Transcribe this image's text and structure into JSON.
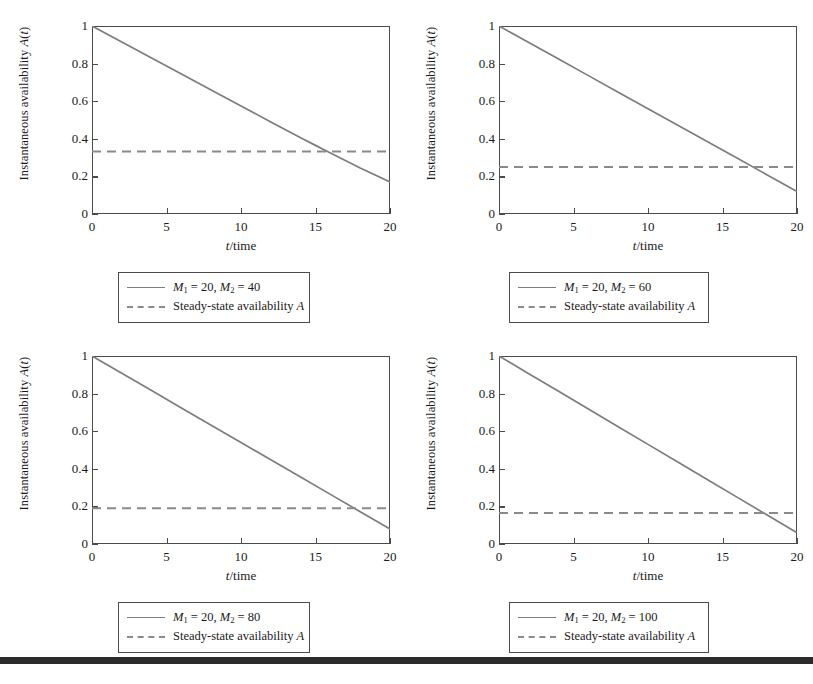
{
  "figure": {
    "axis": {
      "xlabel_plain": "t/time",
      "ylabel_plain": "Instantaneous availability A(t)",
      "yticks": [
        "0",
        "0.2",
        "0.4",
        "0.6",
        "0.8",
        "1"
      ],
      "xticks": [
        "0",
        "5",
        "10",
        "15",
        "20"
      ]
    },
    "colors": {
      "curve": "#7d7d7d",
      "steady_line": "#8a8a8a",
      "frame": "#4b4b4b",
      "text": "#1a1a1a",
      "bottom_rule": "#2b2b2b"
    },
    "panels": [
      {
        "id": "panel-top-left",
        "legend": {
          "series_label": "M1 = 20, M2 = 40",
          "series_M1": "20",
          "series_M2": "40",
          "steady_label": "Steady-state availability A"
        }
      },
      {
        "id": "panel-top-right",
        "legend": {
          "series_label": "M1 = 20, M2 = 60",
          "series_M1": "20",
          "series_M2": "60",
          "steady_label": "Steady-state availability A"
        }
      },
      {
        "id": "panel-bottom-left",
        "legend": {
          "series_label": "M1 = 20, M2 = 80",
          "series_M1": "20",
          "series_M2": "80",
          "steady_label": "Steady-state availability A"
        }
      },
      {
        "id": "panel-bottom-right",
        "legend": {
          "series_label": "M1 = 20, M2 = 100",
          "series_M1": "20",
          "series_M2": "100",
          "steady_label": "Steady-state availability A"
        }
      }
    ]
  },
  "chart_data": [
    {
      "type": "line",
      "title": "",
      "panel": "top-left",
      "xlabel": "t/time",
      "ylabel": "Instantaneous availability A(t)",
      "xlim": [
        0,
        20
      ],
      "ylim": [
        0,
        1
      ],
      "xticks": [
        0,
        5,
        10,
        15,
        20
      ],
      "yticks": [
        0,
        0.2,
        0.4,
        0.6,
        0.8,
        1
      ],
      "grid": false,
      "legend_position": "below-axes",
      "series": [
        {
          "name": "M_1 = 20, M_2 = 40",
          "style": "solid",
          "color": "#7d7d7d",
          "x": [
            0,
            2,
            4,
            6,
            8,
            10,
            12,
            14,
            15,
            16,
            18,
            20
          ],
          "values": [
            1.0,
            0.915,
            0.83,
            0.745,
            0.66,
            0.575,
            0.49,
            0.405,
            0.365,
            0.325,
            0.245,
            0.17
          ]
        },
        {
          "name": "Steady-state availability A",
          "style": "dashed",
          "color": "#8a8a8a",
          "x": [
            0,
            20
          ],
          "values": [
            0.333,
            0.333
          ]
        }
      ]
    },
    {
      "type": "line",
      "title": "",
      "panel": "top-right",
      "xlabel": "t/time",
      "ylabel": "Instantaneous availability A(t)",
      "xlim": [
        0,
        20
      ],
      "ylim": [
        0,
        1
      ],
      "xticks": [
        0,
        5,
        10,
        15,
        20
      ],
      "yticks": [
        0,
        0.2,
        0.4,
        0.6,
        0.8,
        1
      ],
      "grid": false,
      "legend_position": "below-axes",
      "series": [
        {
          "name": "M_1 = 20, M_2 = 60",
          "style": "solid",
          "color": "#7d7d7d",
          "x": [
            0,
            2,
            4,
            6,
            8,
            10,
            12,
            14,
            16,
            18,
            20
          ],
          "values": [
            1.0,
            0.912,
            0.824,
            0.736,
            0.648,
            0.56,
            0.472,
            0.384,
            0.296,
            0.208,
            0.12
          ]
        },
        {
          "name": "Steady-state availability A",
          "style": "dashed",
          "color": "#8a8a8a",
          "x": [
            0,
            20
          ],
          "values": [
            0.25,
            0.25
          ]
        }
      ]
    },
    {
      "type": "line",
      "title": "",
      "panel": "bottom-left",
      "xlabel": "t/time",
      "ylabel": "Instantaneous availability A(t)",
      "xlim": [
        0,
        20
      ],
      "ylim": [
        0,
        1
      ],
      "xticks": [
        0,
        5,
        10,
        15,
        20
      ],
      "yticks": [
        0,
        0.2,
        0.4,
        0.6,
        0.8,
        1
      ],
      "grid": false,
      "legend_position": "below-axes",
      "series": [
        {
          "name": "M_1 = 20, M_2 = 80",
          "style": "solid",
          "color": "#7d7d7d",
          "x": [
            0,
            2,
            4,
            6,
            8,
            10,
            12,
            14,
            16,
            18,
            20
          ],
          "values": [
            1.0,
            0.908,
            0.816,
            0.724,
            0.632,
            0.54,
            0.448,
            0.356,
            0.264,
            0.172,
            0.08
          ]
        },
        {
          "name": "Steady-state availability A",
          "style": "dashed",
          "color": "#8a8a8a",
          "x": [
            0,
            20
          ],
          "values": [
            0.19,
            0.19
          ]
        }
      ]
    },
    {
      "type": "line",
      "title": "",
      "panel": "bottom-right",
      "xlabel": "t/time",
      "ylabel": "Instantaneous availability A(t)",
      "xlim": [
        0,
        20
      ],
      "ylim": [
        0,
        1
      ],
      "xticks": [
        0,
        5,
        10,
        15,
        20
      ],
      "yticks": [
        0,
        0.2,
        0.4,
        0.6,
        0.8,
        1
      ],
      "grid": false,
      "legend_position": "below-axes",
      "series": [
        {
          "name": "M_1 = 20, M_2 = 100",
          "style": "solid",
          "color": "#7d7d7d",
          "x": [
            0,
            2,
            4,
            6,
            8,
            10,
            12,
            14,
            16,
            18,
            20
          ],
          "values": [
            1.0,
            0.906,
            0.812,
            0.718,
            0.624,
            0.53,
            0.436,
            0.342,
            0.248,
            0.154,
            0.06
          ]
        },
        {
          "name": "Steady-state availability A",
          "style": "dashed",
          "color": "#8a8a8a",
          "x": [
            0,
            20
          ],
          "values": [
            0.165,
            0.165
          ]
        }
      ]
    }
  ]
}
